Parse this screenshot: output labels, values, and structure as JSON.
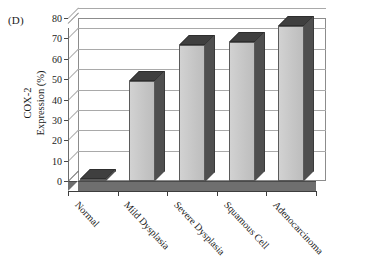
{
  "panel": {
    "label": "(D)"
  },
  "axes": {
    "y_title_line1": "COX-2",
    "y_title_line2": "Expression (%)",
    "y_ticks": [
      "0",
      "10",
      "20",
      "30",
      "40",
      "50",
      "60",
      "70",
      "80"
    ]
  },
  "chart_data": {
    "type": "bar",
    "title": "",
    "xlabel": "",
    "ylabel": "COX-2 Expression (%)",
    "ylim": [
      0,
      80
    ],
    "ytick_step": 10,
    "grid": true,
    "legend": "none",
    "three_d": true,
    "categories": [
      "Normal",
      "Mild Dysplasia",
      "Severe Dysplasia",
      "Squamous Cell",
      "Adenocarcinoma"
    ],
    "values": [
      1,
      49,
      67,
      68,
      76
    ],
    "colors": {
      "bar_face": "#c8c8c8",
      "bar_side": "#4f4f4f",
      "bar_top": "#3f3f3f",
      "grid": "#a9a9a9",
      "axis": "#4a4a4a",
      "floor": "#6f6f6f",
      "background": "#ffffff"
    }
  }
}
